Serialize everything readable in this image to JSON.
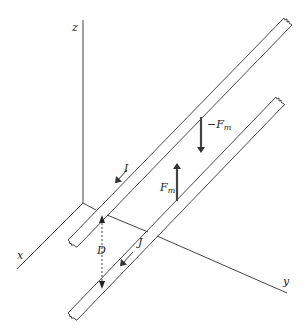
{
  "diagram": {
    "axes": {
      "x_label": "x",
      "y_label": "y",
      "z_label": "z"
    },
    "strips": [
      {
        "name": "upper strip",
        "current_label": "I"
      },
      {
        "name": "lower strip",
        "current_label": "J"
      }
    ],
    "forces": {
      "upper": {
        "sign": "−",
        "symbol": "F",
        "subscript": "m"
      },
      "lower": {
        "sign": "",
        "symbol": "F",
        "subscript": "m"
      }
    },
    "separation_label": "D",
    "colors": {
      "line": "#333333",
      "arrow": "#444444",
      "background": "#ffffff"
    }
  }
}
